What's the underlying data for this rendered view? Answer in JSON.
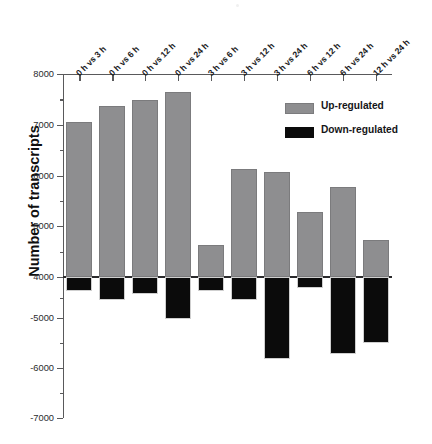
{
  "chart_data": {
    "type": "bar",
    "title": "",
    "xlabel": "",
    "ylabel": "Number of transcripts",
    "grid": false,
    "legend_position": "top-right",
    "axis_note": "broken y-axis: positive branch 4000..8000, negative branch -5000..-7000",
    "ylim": [
      -7000,
      8000
    ],
    "ytick_labels": [
      "8000",
      "7000",
      "6000",
      "5000",
      "4000",
      "-5000",
      "-6000",
      "-7000"
    ],
    "ytick_values": [
      8000,
      7000,
      6000,
      5000,
      4000,
      -5000,
      -6000,
      -7000
    ],
    "categories": [
      "0 h vs 3 h",
      "0 h vs 6 h",
      "0 h vs 12 h",
      "0 h vs 24 h",
      "3 h vs 6 h",
      "3 h vs 12 h",
      "3 h vs 24 h",
      "6 h vs 12 h",
      "6 h vs 24 h",
      "12 h vs 24 h"
    ],
    "series": [
      {
        "name": "Up-regulated",
        "color": "#8e8e90",
        "values": [
          7060,
          7360,
          7480,
          7640,
          4640,
          6130,
          6070,
          5290,
          5780,
          4720
        ]
      },
      {
        "name": "Down-regulated",
        "color": "#0b0b0b",
        "values": [
          -4350,
          -4560,
          -4420,
          -5010,
          -4340,
          -4570,
          -5810,
          -4260,
          -5710,
          -5500
        ]
      }
    ]
  },
  "legend": {
    "items": [
      {
        "label": "Up-regulated",
        "swatch": "up"
      },
      {
        "label": "Down-regulated",
        "swatch": "down"
      }
    ]
  },
  "axis": {
    "y_title": "Number of transcripts"
  }
}
